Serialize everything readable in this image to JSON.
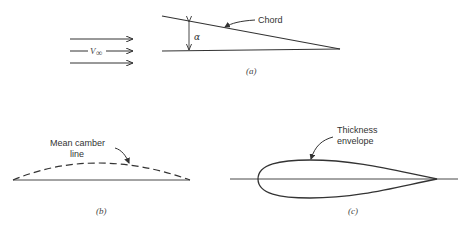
{
  "figure_a": {
    "freestream_label": "V",
    "freestream_subscript": "∞",
    "angle_label": "α",
    "chord_label": "Chord",
    "caption": "(a)"
  },
  "figure_b": {
    "label_line1": "Mean camber",
    "label_line2": "line",
    "caption": "(b)"
  },
  "figure_c": {
    "label_line1": "Thickness",
    "label_line2": "envelope",
    "caption": "(c)"
  },
  "colors": {
    "stroke": "#333333",
    "background": "#ffffff"
  }
}
